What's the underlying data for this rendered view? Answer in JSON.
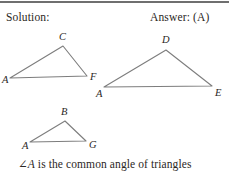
{
  "page": {
    "width": 229,
    "height": 176,
    "background": "#ffffff",
    "ink_color": "#2b2724",
    "line_color": "#7d7d7d",
    "rule_color": "#6f6f6f"
  },
  "header": {
    "solution_label": "Solution:",
    "answer_label": "Answer: (A)"
  },
  "figure": {
    "triangles": [
      {
        "name": "triangle-ACF",
        "vertices": [
          {
            "label": "A",
            "x": 10,
            "y": 52
          },
          {
            "label": "C",
            "x": 63,
            "y": 20
          },
          {
            "label": "F",
            "x": 87,
            "y": 50
          }
        ],
        "label_positions": [
          {
            "label": "A",
            "x": 2,
            "y": 48
          },
          {
            "label": "C",
            "x": 59,
            "y": 5
          },
          {
            "label": "F",
            "x": 90,
            "y": 45
          }
        ]
      },
      {
        "name": "triangle-ADE",
        "vertices": [
          {
            "label": "A",
            "x": 104,
            "y": 61
          },
          {
            "label": "D",
            "x": 166,
            "y": 24
          },
          {
            "label": "E",
            "x": 212,
            "y": 60
          }
        ],
        "label_positions": [
          {
            "label": "A",
            "x": 96,
            "y": 62
          },
          {
            "label": "D",
            "x": 162,
            "y": 8
          },
          {
            "label": "E",
            "x": 215,
            "y": 61
          }
        ]
      },
      {
        "name": "triangle-ABG",
        "vertices": [
          {
            "label": "A",
            "x": 30,
            "y": 116
          },
          {
            "label": "B",
            "x": 65,
            "y": 95
          },
          {
            "label": "G",
            "x": 86,
            "y": 115
          }
        ],
        "label_positions": [
          {
            "label": "A",
            "x": 22,
            "y": 114
          },
          {
            "label": "B",
            "x": 61,
            "y": 80
          },
          {
            "label": "G",
            "x": 89,
            "y": 113
          }
        ]
      }
    ]
  },
  "caption": {
    "angle_symbol": "∠",
    "angle_vertex": "A",
    "text_rest": " is the common angle of triangles"
  }
}
